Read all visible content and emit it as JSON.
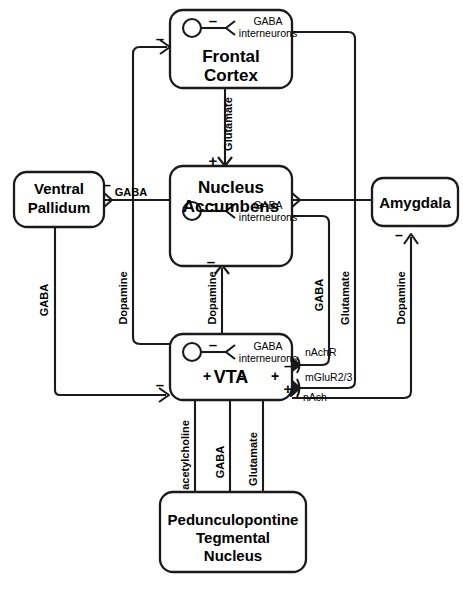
{
  "figure": {
    "type": "neural-circuit-diagram",
    "title": "",
    "line_color": "#1a1a1a",
    "fill_color": "#ffffff",
    "text_color": "#000000"
  },
  "nodes": {
    "frontal_cortex": {
      "label_line1": "Frontal",
      "label_line2": "Cortex",
      "interneuron_label_line1": "GABA",
      "interneuron_label_line2": "interneurons",
      "interneuron_sign": "–",
      "input_sign": "–"
    },
    "nucleus_accumbens": {
      "label_line1": "Nucleus",
      "label_line2": "Accumbens",
      "interneuron_label_line1": "GABA",
      "interneuron_label_line2": "interneurons",
      "interneuron_sign": "–",
      "input_sign_top": "+",
      "output_sign_bottom": "–"
    },
    "ventral_pallidum": {
      "label_line1": "Ventral",
      "label_line2": "Pallidum",
      "input_sign": "–",
      "input_transmitter": "GABA"
    },
    "amygdala": {
      "label_line1": "Amygdala",
      "output_sign": "–"
    },
    "vta": {
      "label_line1": "VTA",
      "interneuron_label_line1": "GABA",
      "interneuron_label_line2": "interneurons",
      "interneuron_sign": "–",
      "input_sign_left": "–",
      "receptor_1_sign": "–",
      "receptor_1_label": "nAchR",
      "receptor_2_sign": "+",
      "receptor_2_label_top": "mGluR2/3",
      "receptor_2_label_bottom": "nAch"
    },
    "ppt_nucleus": {
      "label_line1": "Pedunculopontine",
      "label_line2": "Tegmental",
      "label_line3": "Nucleus"
    }
  },
  "connections": {
    "fc_to_nacc": {
      "transmitter": "Glutamate",
      "sign": "+"
    },
    "vp_to_nacc": {
      "transmitter": "GABA",
      "sign": "–"
    },
    "vp_to_vta": {
      "transmitter": "GABA",
      "sign": "–"
    },
    "vta_to_fc": {
      "transmitter": "Dopamine",
      "sign": "–"
    },
    "vta_to_nacc": {
      "transmitter": "Dopamine",
      "sign": "–"
    },
    "nacc_to_vta": {
      "transmitter": "GABA",
      "sign": "–"
    },
    "fc_to_vta": {
      "transmitter": "Glutamate",
      "sign": "+"
    },
    "vta_to_amygdala": {
      "transmitter": "Dopamine",
      "sign": "–"
    },
    "ppt_to_vta_ach": {
      "transmitter": "acetylcholine",
      "sign": "+"
    },
    "ppt_to_vta_gaba": {
      "transmitter": "GABA",
      "sign": "–"
    },
    "ppt_to_vta_glu": {
      "transmitter": "Glutamate",
      "sign": "+"
    }
  }
}
